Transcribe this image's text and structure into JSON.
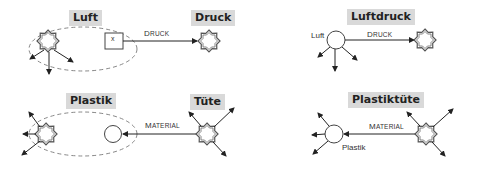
{
  "panels": {
    "top_left": {
      "head_label": "Luft",
      "tail_label": "Druck",
      "edge_label_initial": "D",
      "edge_label_rest": "RUCK",
      "box_text": "x"
    },
    "top_right": {
      "compound_label": "Luftdruck",
      "node_label": "Luft",
      "edge_label_initial": "D",
      "edge_label_rest": "RUCK"
    },
    "bottom_left": {
      "head_label": "Plastik",
      "tail_label": "Tüte",
      "edge_label_initial": "M",
      "edge_label_rest": "ATERIAL"
    },
    "bottom_right": {
      "compound_label": "Plastiktüte",
      "node_label": "Plastik",
      "edge_label_initial": "M",
      "edge_label_rest": "ATERIAL"
    }
  },
  "colors": {
    "label_background": "#d9d9d9",
    "line": "#333333",
    "dashed": "#888888"
  }
}
